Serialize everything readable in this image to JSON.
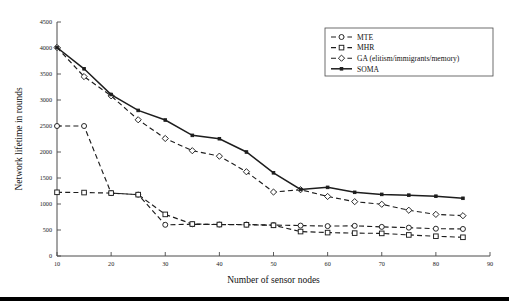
{
  "chart_data": {
    "type": "line",
    "title": "",
    "xlabel": "Number of sensor nodes",
    "ylabel": "Network lifetime in rounds",
    "xlim": [
      10,
      90
    ],
    "ylim": [
      0,
      4500
    ],
    "xticks": [
      10,
      20,
      30,
      40,
      50,
      60,
      70,
      80,
      90
    ],
    "yticks": [
      0,
      500,
      1000,
      1500,
      2000,
      2500,
      3000,
      3500,
      4000,
      4500
    ],
    "grid": false,
    "legend_position": "top-right",
    "x": [
      10,
      15,
      20,
      25,
      30,
      35,
      40,
      45,
      50,
      55,
      60,
      65,
      70,
      75,
      80,
      85
    ],
    "series": [
      {
        "name": "MTE",
        "marker": "circle",
        "linestyle": "dashed",
        "values": [
          2500,
          2500,
          1210,
          1180,
          600,
          610,
          605,
          605,
          595,
          585,
          575,
          580,
          560,
          545,
          525,
          520
        ]
      },
      {
        "name": "MHR",
        "marker": "square",
        "linestyle": "dashed",
        "values": [
          1225,
          1220,
          1210,
          1180,
          800,
          615,
          605,
          600,
          590,
          470,
          450,
          440,
          435,
          405,
          380,
          360
        ]
      },
      {
        "name": "GA (elitism/immigrants/memory)",
        "marker": "diamond",
        "linestyle": "dashed",
        "values": [
          4010,
          3450,
          3080,
          2620,
          2260,
          2025,
          1920,
          1620,
          1230,
          1275,
          1145,
          1045,
          995,
          880,
          800,
          775
        ]
      },
      {
        "name": "SOMA",
        "marker": "point",
        "linestyle": "solid",
        "values": [
          4010,
          3600,
          3105,
          2800,
          2615,
          2320,
          2255,
          2000,
          1600,
          1280,
          1320,
          1225,
          1185,
          1170,
          1150,
          1110
        ]
      }
    ],
    "legend_entries": [
      "MTE",
      "MHR",
      "GA (elitism/immigrants/memory)",
      "SOMA"
    ]
  }
}
